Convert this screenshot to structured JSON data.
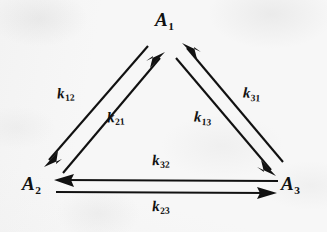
{
  "figure": {
    "type": "kinetic-scheme-triangle",
    "ink_color": "#111111",
    "paper_color": "#f7f7f7"
  },
  "nodes": [
    {
      "id": "A1",
      "symbol": "A",
      "subscript": "1",
      "label": "A1",
      "position": "apex"
    },
    {
      "id": "A2",
      "symbol": "A",
      "subscript": "2",
      "label": "A2",
      "position": "bottom-left"
    },
    {
      "id": "A3",
      "symbol": "A",
      "subscript": "3",
      "label": "A3",
      "position": "bottom-right"
    }
  ],
  "rates": [
    {
      "id": "k12",
      "symbol": "k",
      "subscript": "12",
      "from": "A1",
      "to": "A2",
      "edge": "left",
      "side": "outer"
    },
    {
      "id": "k21",
      "symbol": "k",
      "subscript": "21",
      "from": "A2",
      "to": "A1",
      "edge": "left",
      "side": "inner"
    },
    {
      "id": "k31",
      "symbol": "k",
      "subscript": "31",
      "from": "A3",
      "to": "A1",
      "edge": "right",
      "side": "outer"
    },
    {
      "id": "k13",
      "symbol": "k",
      "subscript": "13",
      "from": "A1",
      "to": "A3",
      "edge": "right",
      "side": "inner"
    },
    {
      "id": "k32",
      "symbol": "k",
      "subscript": "32",
      "from": "A3",
      "to": "A2",
      "edge": "bottom",
      "side": "upper"
    },
    {
      "id": "k23",
      "symbol": "k",
      "subscript": "23",
      "from": "A2",
      "to": "A3",
      "edge": "bottom",
      "side": "lower"
    }
  ]
}
